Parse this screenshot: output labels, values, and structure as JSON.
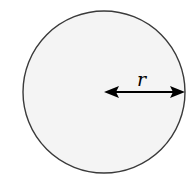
{
  "diagram": {
    "type": "circle-radius",
    "circle": {
      "cx": 104,
      "cy": 92,
      "r": 81,
      "fill": "#f4f4f4",
      "stroke": "#3a3a3a"
    },
    "radius_arrow": {
      "x1": 104,
      "x2": 185,
      "y": 92,
      "color": "#000000",
      "double_headed": true
    },
    "label": "r"
  }
}
